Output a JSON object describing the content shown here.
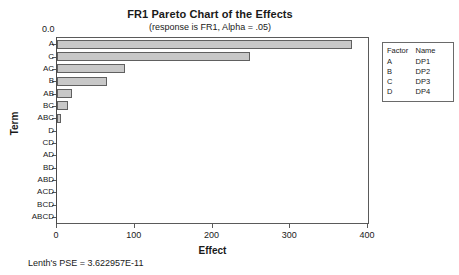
{
  "chart_data": {
    "type": "bar",
    "orientation": "horizontal",
    "title": "FR1 Pareto Chart of the Effects",
    "subtitle": "(response is FR1, Alpha = .05)",
    "xlabel": "Effect",
    "ylabel": "Term",
    "categories": [
      "A",
      "C",
      "AC",
      "B",
      "AB",
      "BC",
      "ABC",
      "D",
      "CD",
      "AD",
      "BD",
      "ABD",
      "ACD",
      "BCD",
      "ABCD"
    ],
    "values": [
      380,
      248,
      88,
      64,
      19,
      14,
      5,
      0,
      0,
      0,
      0,
      0,
      0,
      0,
      0
    ],
    "xlim": [
      0,
      400
    ],
    "xticks": [
      0,
      100,
      200,
      300,
      400
    ],
    "xtick_labels": [
      "0",
      "100",
      "200",
      "300",
      "400"
    ],
    "grid": false,
    "reference_line": {
      "value": 0.0,
      "label": "0.0"
    },
    "bar_fill_color": "#c8c8c8",
    "bar_edge_color": "#606060",
    "legend_position": "right-outside"
  },
  "legend": {
    "headers": {
      "factor": "Factor",
      "name": "Name"
    },
    "rows": [
      {
        "factor": "A",
        "name": "DP1"
      },
      {
        "factor": "B",
        "name": "DP2"
      },
      {
        "factor": "C",
        "name": "DP3"
      },
      {
        "factor": "D",
        "name": "DP4"
      }
    ]
  },
  "footer": {
    "note": "Lenth's PSE = 3.622957E-11"
  }
}
